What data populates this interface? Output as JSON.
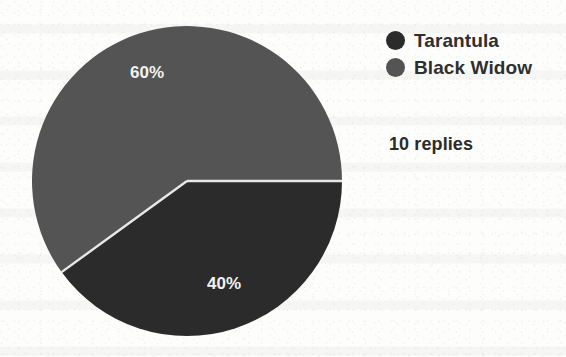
{
  "chart_data": {
    "type": "pie",
    "title": "",
    "categories": [
      "Tarantula",
      "Black Widow"
    ],
    "values": [
      40,
      60
    ],
    "value_unit": "percent",
    "data_labels": [
      "40%",
      "60%"
    ],
    "legend_position": "right",
    "grid": false,
    "colors": [
      "#2b2b2b",
      "#545454"
    ],
    "start_angle_deg": 0,
    "direction": "clockwise",
    "annotations": [
      "10 replies"
    ]
  },
  "legend": {
    "items": [
      {
        "label": "Tarantula",
        "swatch_color": "#2b2b2b",
        "swatch_icon": "circle-swatch-icon",
        "value": "40%"
      },
      {
        "label": "Black Widow",
        "swatch_color": "#545454",
        "swatch_icon": "circle-swatch-icon",
        "value": "60%"
      }
    ]
  },
  "pie": {
    "slices": [
      {
        "name": "Tarantula",
        "label": "40%",
        "percent": 40,
        "color": "#2b2b2b"
      },
      {
        "name": "Black Widow",
        "label": "60%",
        "percent": 60,
        "color": "#545454"
      }
    ],
    "separator_color": "#e8e8e6"
  },
  "footer": {
    "replies_text": "10 replies"
  },
  "page": {
    "background_color": "#fdfdfc"
  }
}
